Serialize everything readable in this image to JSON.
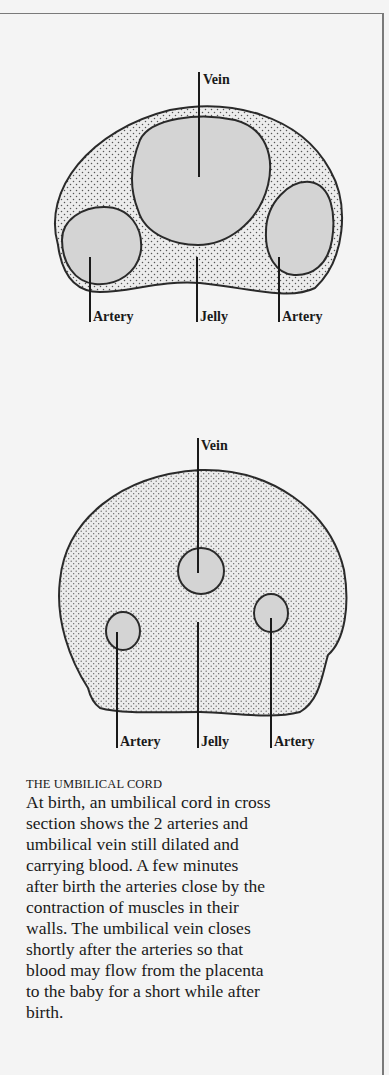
{
  "figure": {
    "frame": {
      "border_color": "#7a7a7a",
      "background": "#f4f4f4"
    },
    "colors": {
      "vessel_fill": "#d4d4d4",
      "jelly_fill": "#ececec",
      "stipple": "#555555",
      "outline": "#2a2a2a"
    },
    "diagram_top": {
      "description": "Umbilical cord cross section at birth - vessels dilated",
      "labels": {
        "vein": "Vein",
        "artery_left": "Artery",
        "jelly": "Jelly",
        "artery_right": "Artery"
      }
    },
    "diagram_bottom": {
      "description": "Umbilical cord cross section after closure - vessels constricted",
      "labels": {
        "vein": "Vein",
        "artery_left": "Artery",
        "jelly": "Jelly",
        "artery_right": "Artery"
      }
    },
    "caption": {
      "title": "THE UMBILICAL CORD",
      "lines": [
        "At birth, an umbilical cord in cross",
        "section shows the 2 arteries and",
        "umbilical vein still dilated and",
        "carrying blood. A few minutes",
        "after birth the arteries close by the",
        "contraction of muscles in their",
        "walls. The umbilical vein closes",
        "shortly after the arteries so that",
        "blood may flow from the placenta",
        "to the baby for a short while after",
        "birth."
      ]
    }
  }
}
